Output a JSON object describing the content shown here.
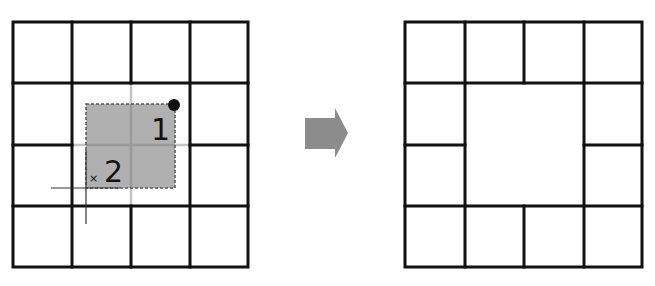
{
  "diagram": {
    "colors": {
      "grid_line": "#111111",
      "faded_line": "#c4c4c4",
      "selection_fill": "#b0b0b0",
      "selection_inner_line": "#9a9a9a",
      "selection_border": "#555555",
      "arrow": "#8c8c8c",
      "handle": "#111111"
    },
    "before": {
      "rows": 4,
      "cols": 4,
      "selection": {
        "from_cell": [
          1,
          1
        ],
        "to_cell": [
          2,
          2
        ]
      },
      "labels": {
        "start": "1",
        "end": "2",
        "cursor": "×"
      }
    },
    "arrow": {
      "direction": "right"
    },
    "after": {
      "rows": 4,
      "cols": 4,
      "merged_cell": {
        "row": 1,
        "col": 1,
        "rowspan": 2,
        "colspan": 2
      }
    }
  }
}
